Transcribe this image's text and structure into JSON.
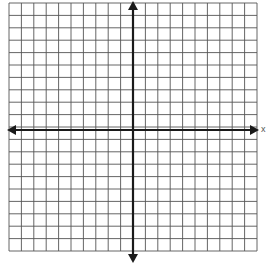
{
  "diagram": {
    "type": "coordinate-plane",
    "grid": {
      "columns": 20,
      "rows": 20,
      "left": 9,
      "top": 3,
      "cell": 12.4,
      "line_color": "#555555"
    },
    "axes": {
      "color": "#1a1a1a",
      "x_axis_y": 130,
      "y_axis_x": 133
    },
    "x_label": "x"
  }
}
